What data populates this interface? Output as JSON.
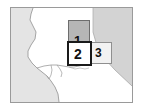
{
  "thumbnail": {
    "title": "Map region selector thumbnail",
    "width": 143,
    "height": 110,
    "background_color": "#ffffff",
    "frame_border_color": "#9a9a9a"
  },
  "map": {
    "name": "coastline-map",
    "description": "Coastline map of the San Francisco Bay region with inland area",
    "land_color": "#ffffff",
    "water_color": "#e2e2e2",
    "shaded_region_color": "#d2d2d2",
    "coastline_color": "#9b9b9b",
    "labels": []
  },
  "regions": [
    {
      "id": "region-1",
      "label": "1",
      "selected": false,
      "fill_color": "#b6b6b6",
      "border_color": "#6d6d6d"
    },
    {
      "id": "region-2",
      "label": "2",
      "selected": true,
      "fill_color": "#ffffff",
      "border_color": "#1a1a1a"
    },
    {
      "id": "region-3",
      "label": "3",
      "selected": false,
      "fill_color": "#f2f2f2",
      "border_color": "#8f8f8f"
    }
  ]
}
